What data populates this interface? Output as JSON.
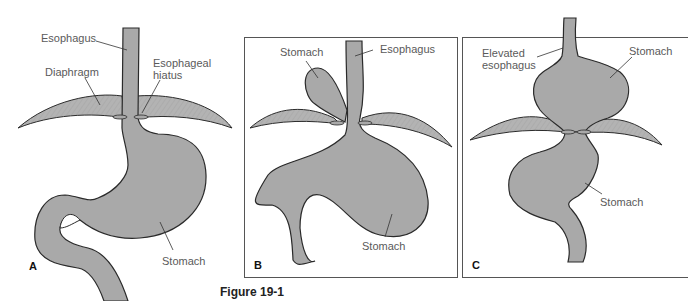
{
  "figure": {
    "caption": "Figure 19-1",
    "fill_color": "#a9a9a9",
    "outline_color": "#2a2a2a",
    "label_color": "#5a5a5a"
  },
  "panels": {
    "a": {
      "letter": "A",
      "labels": {
        "esophagus": "Esophagus",
        "diaphragm": "Diaphragm",
        "hiatus_line1": "Esophageal",
        "hiatus_line2": "hiatus",
        "stomach": "Stomach"
      }
    },
    "b": {
      "letter": "B",
      "labels": {
        "stomach_top": "Stomach",
        "esophagus": "Esophagus",
        "stomach_bottom": "Stomach"
      }
    },
    "c": {
      "letter": "C",
      "labels": {
        "elevated_line1": "Elevated",
        "elevated_line2": "esophagus",
        "stomach_top": "Stomach",
        "stomach_bottom": "Stomach"
      }
    }
  }
}
